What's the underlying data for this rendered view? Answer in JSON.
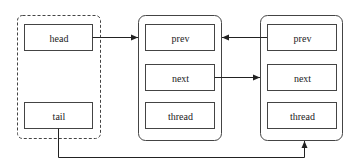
{
  "diagram": {
    "type": "linked-list",
    "colors": {
      "stroke": "#333333",
      "background": "#ffffff"
    },
    "queue": {
      "head_label": "head",
      "tail_label": "tail"
    },
    "nodes": [
      {
        "fields": [
          "prev",
          "next",
          "thread"
        ]
      },
      {
        "fields": [
          "prev",
          "next",
          "thread"
        ]
      }
    ],
    "edges": [
      {
        "from": "head",
        "to": "node1",
        "style": "arrow"
      },
      {
        "from": "node2.prev",
        "to": "node1",
        "style": "arrow"
      },
      {
        "from": "node1.next",
        "to": "node2",
        "style": "arrow"
      },
      {
        "from": "tail",
        "to": "node2",
        "style": "elbow-arrow"
      }
    ]
  }
}
